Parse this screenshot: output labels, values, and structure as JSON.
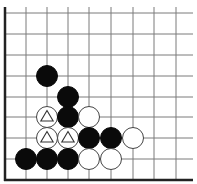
{
  "board": {
    "type": "go-diagram",
    "region": "lower-left corner",
    "line_color": "#7a7a7a",
    "edge_color": "#222222",
    "background": "#ffffff",
    "columns_x": [
      5,
      26,
      47,
      68,
      89,
      111,
      133,
      154,
      176
    ],
    "rows_y": [
      13,
      34,
      55,
      76,
      97,
      117,
      138,
      159,
      180
    ],
    "right_extent": 193,
    "stone_radius": 10.5,
    "edges": {
      "left": true,
      "bottom": true
    }
  },
  "stones": [
    {
      "color": "black",
      "col": 2,
      "row": 3,
      "marker": null
    },
    {
      "color": "black",
      "col": 3,
      "row": 4,
      "marker": null
    },
    {
      "color": "white",
      "col": 2,
      "row": 5,
      "marker": "triangle"
    },
    {
      "color": "black",
      "col": 3,
      "row": 5,
      "marker": null
    },
    {
      "color": "white",
      "col": 4,
      "row": 5,
      "marker": null
    },
    {
      "color": "white",
      "col": 2,
      "row": 6,
      "marker": "triangle"
    },
    {
      "color": "white",
      "col": 3,
      "row": 6,
      "marker": "triangle"
    },
    {
      "color": "black",
      "col": 4,
      "row": 6,
      "marker": null
    },
    {
      "color": "black",
      "col": 5,
      "row": 6,
      "marker": null
    },
    {
      "color": "white",
      "col": 6,
      "row": 6,
      "marker": null
    },
    {
      "color": "black",
      "col": 1,
      "row": 7,
      "marker": null
    },
    {
      "color": "black",
      "col": 2,
      "row": 7,
      "marker": null
    },
    {
      "color": "black",
      "col": 3,
      "row": 7,
      "marker": null
    },
    {
      "color": "white",
      "col": 4,
      "row": 7,
      "marker": null
    },
    {
      "color": "white",
      "col": 5,
      "row": 7,
      "marker": null
    }
  ]
}
